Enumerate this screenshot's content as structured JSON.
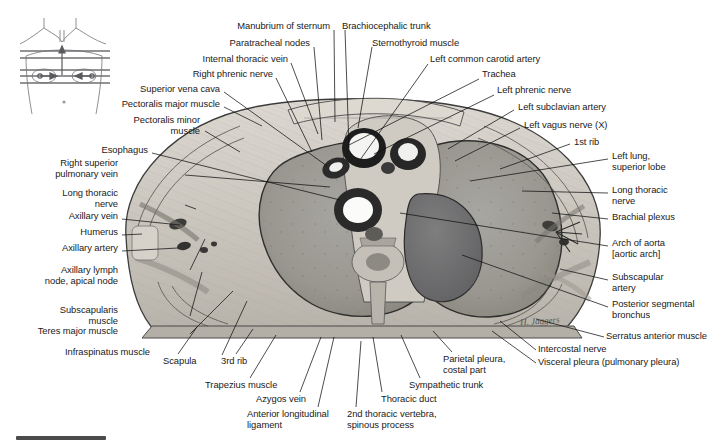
{
  "figure": {
    "type": "anatomical-cross-section",
    "region": "Thorax, transverse section at level of T2 vertebra",
    "orientation_key": "torso-with-section-lines",
    "signature": "H. Jaggers"
  },
  "labels_top": [
    {
      "id": "manubrium-of-sternum",
      "text": "Manubrium of sternum",
      "x": 330,
      "y": 26,
      "align": "right",
      "tip": [
        335,
        122
      ]
    },
    {
      "id": "paratracheal-nodes",
      "text": "Paratracheal nodes",
      "x": 310,
      "y": 43,
      "align": "right",
      "tip": [
        322,
        140
      ]
    },
    {
      "id": "brachiocephalic-trunk",
      "text": "Brachiocephalic trunk",
      "x": 342,
      "y": 26,
      "align": "left",
      "tip": [
        349,
        148
      ]
    },
    {
      "id": "sternothyroid-muscle",
      "text": "Sternothyroid muscle",
      "x": 372,
      "y": 42,
      "align": "left",
      "tip": [
        358,
        128
      ]
    },
    {
      "id": "internal-thoracic-vein",
      "text": "Internal thoracic vein",
      "x": 288,
      "y": 59,
      "align": "right",
      "tip": [
        318,
        134
      ]
    },
    {
      "id": "right-phrenic-nerve",
      "text": "Right phrenic nerve",
      "x": 273,
      "y": 74,
      "align": "right",
      "tip": [
        312,
        152
      ]
    },
    {
      "id": "left-common-carotid-artery",
      "text": "Left common carotid artery",
      "x": 430,
      "y": 59,
      "align": "left",
      "tip": [
        360,
        160
      ]
    },
    {
      "id": "trachea",
      "text": "Trachea",
      "x": 482,
      "y": 74,
      "align": "left",
      "tip": [
        347,
        144
      ]
    },
    {
      "id": "left-phrenic-nerve",
      "text": "Left phrenic nerve",
      "x": 497,
      "y": 90,
      "align": "left",
      "tip": [
        373,
        152
      ]
    }
  ],
  "labels_left": [
    {
      "id": "superior-vena-cava",
      "text": "Superior vena cava",
      "x": 220,
      "y": 89,
      "align": "right",
      "tip": [
        327,
        166
      ]
    },
    {
      "id": "pectoralis-major-muscle",
      "text": "Pectoralis major muscle",
      "x": 220,
      "y": 104,
      "align": "right",
      "tip": [
        262,
        125
      ]
    },
    {
      "id": "pectoralis-minor-muscle",
      "text": "Pectoralis minor\nmuscle",
      "x": 200,
      "y": 120,
      "align": "right",
      "tip": [
        240,
        152
      ]
    },
    {
      "id": "esophagus",
      "text": "Esophagus",
      "x": 148,
      "y": 150,
      "align": "right",
      "tip": [
        340,
        200
      ]
    },
    {
      "id": "right-superior-pulmonary-vein",
      "text": "Right superior\npulmonary vein",
      "x": 118,
      "y": 163,
      "align": "right",
      "tip": [
        330,
        186
      ]
    },
    {
      "id": "long-thoracic-nerve-left",
      "text": "Long thoracic\nnerve",
      "x": 118,
      "y": 193,
      "align": "right",
      "tip": [
        196,
        208
      ]
    },
    {
      "id": "axillary-vein",
      "text": "Axillary vein",
      "x": 118,
      "y": 216,
      "align": "right",
      "tip": [
        180,
        224
      ]
    },
    {
      "id": "humerus",
      "text": "Humerus",
      "x": 118,
      "y": 232,
      "align": "right",
      "tip": [
        142,
        233
      ]
    },
    {
      "id": "axillary-artery",
      "text": "Axillary artery",
      "x": 118,
      "y": 248,
      "align": "right",
      "tip": [
        178,
        247
      ]
    },
    {
      "id": "axillary-lymph-node",
      "text": "Axillary lymph\nnode, apical node",
      "x": 118,
      "y": 270,
      "align": "right",
      "tip": [
        205,
        238
      ]
    },
    {
      "id": "subscapularis-muscle",
      "text": "Subscapularis\nmuscle",
      "x": 118,
      "y": 310,
      "align": "right",
      "tip": [
        200,
        272
      ]
    },
    {
      "id": "teres-major-muscle",
      "text": "Teres major muscle",
      "x": 118,
      "y": 331,
      "align": "right",
      "tip": [
        232,
        290
      ]
    },
    {
      "id": "infraspinatus-muscle",
      "text": "Infraspinatus muscle",
      "x": 150,
      "y": 352,
      "align": "right",
      "tip": [
        246,
        300
      ]
    }
  ],
  "labels_right": [
    {
      "id": "left-subclavian-artery",
      "text": "Left subclavian artery",
      "x": 518,
      "y": 107,
      "align": "left",
      "tip": [
        448,
        148
      ]
    },
    {
      "id": "left-vagus-nerve",
      "text": "Left vagus nerve (X)",
      "x": 524,
      "y": 125,
      "align": "left",
      "tip": [
        455,
        160
      ]
    },
    {
      "id": "1st-rib",
      "text": "1st rib",
      "x": 574,
      "y": 141,
      "align": "left",
      "tip": [
        500,
        168
      ]
    },
    {
      "id": "left-lung-superior-lobe",
      "text": "Left lung,\nsuperior lobe",
      "x": 612,
      "y": 156,
      "align": "left",
      "tip": [
        470,
        180
      ]
    },
    {
      "id": "long-thoracic-nerve-right",
      "text": "Long thoracic\nnerve",
      "x": 612,
      "y": 190,
      "align": "left",
      "tip": [
        522,
        190
      ]
    },
    {
      "id": "brachial-plexus",
      "text": "Brachial plexus",
      "x": 612,
      "y": 216,
      "align": "left",
      "tip": [
        552,
        212
      ]
    },
    {
      "id": "arch-of-aorta",
      "text": "Arch of aorta\n[aortic arch]",
      "x": 612,
      "y": 243,
      "align": "left",
      "tip": [
        400,
        212
      ]
    },
    {
      "id": "subscapular-artery",
      "text": "Subscapular\nartery",
      "x": 612,
      "y": 277,
      "align": "left",
      "tip": [
        560,
        268
      ]
    },
    {
      "id": "posterior-segmental-bronchus",
      "text": "Posterior segmental\nbronchus",
      "x": 612,
      "y": 304,
      "align": "left",
      "tip": [
        462,
        254
      ]
    },
    {
      "id": "serratus-anterior-muscle",
      "text": "Serratus anterior muscle",
      "x": 608,
      "y": 334,
      "align": "left",
      "tip": [
        536,
        318
      ]
    },
    {
      "id": "intercostal-nerve",
      "text": "Intercostal nerve",
      "x": 540,
      "y": 347,
      "align": "left",
      "tip": [
        500,
        320
      ]
    },
    {
      "id": "visceral-pleura",
      "text": "Visceral pleura (pulmonary pleura)",
      "x": 540,
      "y": 360,
      "align": "left",
      "tip": [
        492,
        330
      ]
    }
  ],
  "labels_bottom": [
    {
      "id": "scapula",
      "text": "Scapula",
      "x": 165,
      "y": 360,
      "align": "left",
      "tip": [
        196,
        326
      ]
    },
    {
      "id": "3rd-rib",
      "text": "3rd rib",
      "x": 223,
      "y": 360,
      "align": "left",
      "tip": [
        252,
        328
      ]
    },
    {
      "id": "trapezius-muscle",
      "text": "Trapezius muscle",
      "x": 207,
      "y": 384,
      "align": "left",
      "tip": [
        275,
        334
      ]
    },
    {
      "id": "azygos-vein",
      "text": "Azygos vein",
      "x": 258,
      "y": 398,
      "align": "left",
      "tip": [
        320,
        336
      ]
    },
    {
      "id": "anterior-longitudinal-ligament",
      "text": "Anterior longitudinal\nligament",
      "x": 249,
      "y": 413,
      "align": "left",
      "tip": [
        333,
        336
      ]
    },
    {
      "id": "2nd-thoracic-vertebra",
      "text": "2nd thoracic vertebra,\nspinous process",
      "x": 349,
      "y": 413,
      "align": "left",
      "tip": [
        360,
        340
      ]
    },
    {
      "id": "thoracic-duct",
      "text": "Thoracic duct",
      "x": 383,
      "y": 398,
      "align": "left",
      "tip": [
        372,
        336
      ]
    },
    {
      "id": "sympathetic-trunk",
      "text": "Sympathetic trunk",
      "x": 411,
      "y": 384,
      "align": "left",
      "tip": [
        400,
        334
      ]
    },
    {
      "id": "parietal-pleura-costal-part",
      "text": "Parietal pleura,\ncostal part",
      "x": 445,
      "y": 358,
      "align": "left",
      "tip": [
        432,
        330
      ]
    }
  ],
  "colors": {
    "text": "#1a1a1a",
    "leader": "#111111",
    "background": "#ffffff",
    "bottom_bar": "#4b4b4b",
    "lung_fill": "#9a9a96",
    "aorta_fill": "#6f6f70",
    "tissue_fill": "#c9c7c2",
    "outline": "#2a2a2a"
  }
}
